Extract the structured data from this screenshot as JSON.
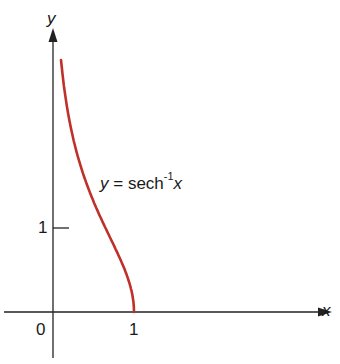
{
  "chart_data": {
    "type": "line",
    "title": "",
    "xlabel": "x",
    "ylabel": "y",
    "annotation": {
      "lhs": "y",
      "eq": "=",
      "func": "sech",
      "exp": "-1",
      "arg": "x"
    },
    "x_ticks": [
      {
        "value": 0,
        "label": "0"
      },
      {
        "value": 1,
        "label": "1"
      }
    ],
    "y_ticks": [
      {
        "value": 1,
        "label": "1"
      }
    ],
    "xlim": [
      -0.65,
      3.45
    ],
    "ylim": [
      -0.5,
      3.6
    ],
    "series": [
      {
        "name": "y = sech^-1 x",
        "color": "#c0302a",
        "x": [
          0.1,
          0.15,
          0.2,
          0.3,
          0.4,
          0.5,
          0.6,
          0.7,
          0.8,
          0.9,
          0.95,
          1.0
        ],
        "y": [
          2.99,
          2.59,
          2.29,
          1.87,
          1.57,
          1.32,
          1.1,
          0.9,
          0.69,
          0.47,
          0.32,
          0.0
        ]
      }
    ],
    "grid": false,
    "legend": "none"
  }
}
